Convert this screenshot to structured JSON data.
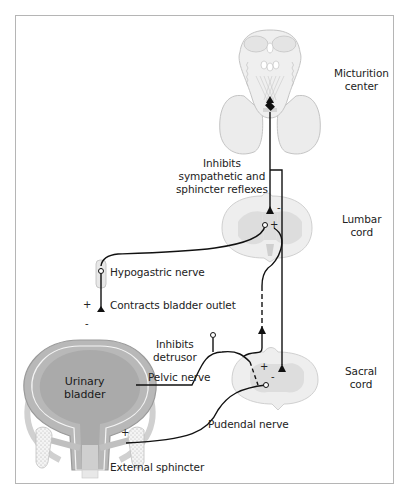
{
  "structures": {
    "micturition_center": {
      "line1": "Micturition",
      "line2": "center"
    },
    "lumbar_cord": {
      "line1": "Lumbar",
      "line2": "cord"
    },
    "sacral_cord": {
      "line1": "Sacral",
      "line2": "cord"
    },
    "urinary_bladder": {
      "line1": "Urinary",
      "line2": "bladder"
    }
  },
  "annotations": {
    "inhibits_reflexes": {
      "line1": "Inhibits",
      "line2": "sympathetic and",
      "line3": "sphincter reflexes"
    },
    "hypogastric_nerve": "Hypogastric nerve",
    "contracts_outlet": "Contracts bladder outlet",
    "inhibits_detrusor": {
      "line1": "Inhibits",
      "line2": "detrusor"
    },
    "pelvic_nerve": "Pelvic nerve",
    "pudendal_nerve": "Pudendal nerve",
    "external_sphincter": "External sphincter"
  },
  "signs": {
    "lumbar_minus": "-",
    "lumbar_plus": "+",
    "outlet_plus": "+",
    "outlet_minus": "-",
    "sacral_plus": "+",
    "sacral_minus": "-",
    "sphincter_plus": "+"
  },
  "colors": {
    "tissue_fill": "#ededed",
    "tissue_stroke": "#bdbdbd",
    "grey_matter": "#d9d9d9",
    "bladder_fill": "#a9a9a9",
    "bladder_wall": "#8f8f8f",
    "nerve": "#111111",
    "frame": "#b5b5b5"
  }
}
